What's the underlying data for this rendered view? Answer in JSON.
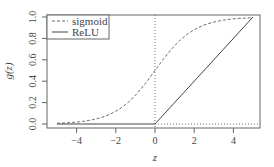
{
  "chart_data": {
    "type": "line",
    "title": "",
    "xlabel": "z",
    "ylabel": "g(z)",
    "xlim": [
      -5.4,
      5.4
    ],
    "ylim": [
      -0.04,
      1.04
    ],
    "x_ticks": [
      -4,
      -2,
      0,
      2,
      4
    ],
    "x_tick_labels": [
      "−4",
      "−2",
      "0",
      "2",
      "4"
    ],
    "y_ticks": [
      0.0,
      0.2,
      0.4,
      0.6,
      0.8,
      1.0
    ],
    "y_tick_labels": [
      "0.0",
      "0.2",
      "0.4",
      "0.6",
      "0.8",
      "1.0"
    ],
    "grid": false,
    "legend_position": "top-left",
    "series": [
      {
        "name": "sigmoid",
        "style": "dashed",
        "function": "1/(1+exp(-z))",
        "x": [
          -5,
          -4,
          -3,
          -2,
          -1,
          0,
          1,
          2,
          3,
          4,
          5
        ],
        "values": [
          0.007,
          0.018,
          0.047,
          0.119,
          0.269,
          0.5,
          0.731,
          0.881,
          0.953,
          0.982,
          0.993
        ]
      },
      {
        "name": "ReLU",
        "style": "solid",
        "function": "max(0,z)/5",
        "x": [
          -5,
          0,
          5
        ],
        "values": [
          0.0,
          0.0,
          1.0
        ]
      }
    ],
    "reference_lines": [
      {
        "orientation": "vertical",
        "at": 0,
        "style": "dotted"
      },
      {
        "orientation": "horizontal",
        "at": 0,
        "style": "dotted"
      }
    ]
  },
  "legend": {
    "items": [
      {
        "label": "sigmoid",
        "style": "dashed"
      },
      {
        "label": "ReLU",
        "style": "solid"
      }
    ]
  },
  "axes": {
    "xlabel": "z",
    "ylabel": "g(z)",
    "x_tick_labels": [
      "−4",
      "−2",
      "0",
      "2",
      "4"
    ],
    "y_tick_labels": [
      "0.0",
      "0.2",
      "0.4",
      "0.6",
      "0.8",
      "1.0"
    ]
  }
}
